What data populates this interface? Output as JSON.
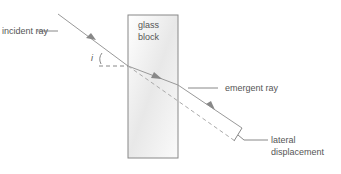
{
  "labels": {
    "incident_ray": "incident ray",
    "glass_block_1": "glass",
    "glass_block_2": "block",
    "angle": "i",
    "emergent_ray": "emergent ray",
    "lateral_1": "lateral",
    "lateral_2": "displacement"
  },
  "colors": {
    "line": "#8a8a8a",
    "text": "#555555"
  }
}
